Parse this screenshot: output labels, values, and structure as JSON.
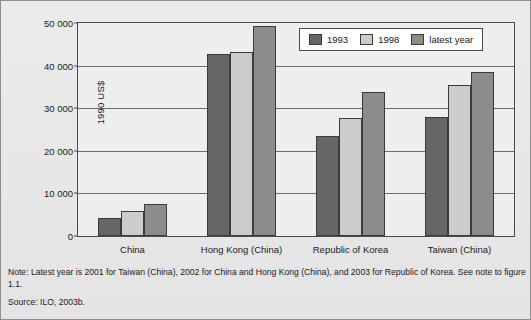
{
  "chart_data": {
    "type": "bar",
    "title": "",
    "xlabel": "",
    "ylabel": "1990 US$",
    "ylim": [
      0,
      50000
    ],
    "ytick_step": 10000,
    "ytick_labels": [
      "50 000",
      "40 000",
      "30 000",
      "20 000",
      "10 000",
      "0"
    ],
    "ytick_values": [
      50000,
      40000,
      30000,
      20000,
      10000,
      0
    ],
    "grid": true,
    "legend_position": "top-right",
    "categories": [
      "China",
      "Hong Kong (China)",
      "Republic of Korea",
      "Taiwan (China)"
    ],
    "series": [
      {
        "name": "1993",
        "color": "#666666",
        "values": [
          4200,
          42700,
          23400,
          28000
        ]
      },
      {
        "name": "1998",
        "color": "#cccccc",
        "values": [
          5800,
          43100,
          27800,
          35500
        ]
      },
      {
        "name": "latest year",
        "color": "#8c8c8c",
        "values": [
          7500,
          49300,
          33900,
          38500
        ]
      }
    ]
  },
  "footnotes": {
    "note": "Note: Latest year is 2001 for Taiwan (China), 2002 for China and Hong Kong (China), and 2003 for Republic of Korea. See note to figure 1.1.",
    "source": "Source: ILO, 2003b."
  },
  "colors": {
    "series_1993": "#666666",
    "series_1998": "#cccccc",
    "series_latest": "#8c8c8c",
    "background": "#e9e9e9",
    "plot_background": "#eeeeee",
    "axis": "#4a4a4a"
  }
}
